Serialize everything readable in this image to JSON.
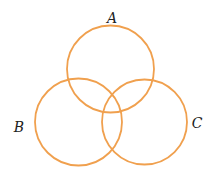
{
  "diagram": {
    "type": "venn",
    "stroke_color": "#f0a04e",
    "sets": [
      {
        "label": "A",
        "cx": 110.5,
        "cy": 69,
        "r": 43.5,
        "label_x": 112,
        "label_y": 23
      },
      {
        "label": "B",
        "cx": 78.5,
        "cy": 122,
        "r": 43.5,
        "label_x": 19,
        "label_y": 131
      },
      {
        "label": "C",
        "cx": 144.5,
        "cy": 122,
        "r": 42.5,
        "label_x": 197,
        "label_y": 127
      }
    ]
  }
}
